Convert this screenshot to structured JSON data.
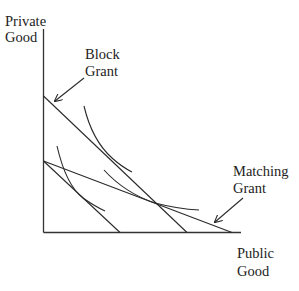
{
  "diagram": {
    "y_axis_label": [
      "Private",
      "Good"
    ],
    "x_axis_label": [
      "Public",
      "Good"
    ],
    "annotations": {
      "block_grant": [
        "Block",
        "Grant"
      ],
      "matching_grant": [
        "Matching",
        "Grant"
      ]
    },
    "colors": {
      "lines": "#2a2a2a",
      "text": "#222222",
      "background": "#ffffff"
    },
    "elements": [
      {
        "name": "original-budget-line",
        "from": [
          43,
          161
        ],
        "to": [
          120,
          232
        ]
      },
      {
        "name": "block-grant-budget-line",
        "from": [
          43,
          96
        ],
        "to": [
          187,
          232
        ]
      },
      {
        "name": "matching-grant-budget-line",
        "from": [
          43,
          161
        ],
        "to": [
          232,
          232
        ]
      },
      {
        "name": "indifference-curve-low",
        "tangent_to": "original-budget-line"
      },
      {
        "name": "indifference-curve-block",
        "tangent_to": "block-grant-budget-line"
      },
      {
        "name": "indifference-curve-matching",
        "tangent_to": "matching-grant-budget-line"
      }
    ]
  }
}
